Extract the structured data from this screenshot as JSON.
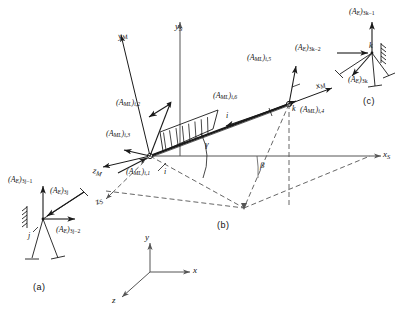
{
  "figure": {
    "background_color": "#ffffff",
    "line_color": "#1a1a1a",
    "dashed_color": "#555555"
  },
  "captions": {
    "a": "(a)",
    "b": "(b)",
    "c": "(c)"
  },
  "axes": {
    "member_x": "x",
    "member_x_sub": "M",
    "member_y": "y",
    "member_y_sub": "M",
    "member_z": "z",
    "member_z_sub": "M",
    "structure_x": "x",
    "structure_x_sub": "S",
    "structure_y": "y",
    "structure_y_sub": "S",
    "structure_z": "z",
    "structure_z_sub": "S",
    "global_x": "x",
    "global_y": "y",
    "global_z": "z"
  },
  "angles": {
    "gamma": "γ",
    "beta": "β"
  },
  "nodes": {
    "i": "i",
    "k": "k",
    "member_length": "i",
    "inset_a_node": "j",
    "inset_c_node": "k"
  },
  "member_loads": {
    "prefix": "(A",
    "prefix_sub": "ML",
    "close": ")",
    "items": [
      {
        "id": "aml_i1",
        "sub": "i,1"
      },
      {
        "id": "aml_i2",
        "sub": "i,2"
      },
      {
        "id": "aml_i3",
        "sub": "i,3"
      },
      {
        "id": "aml_i4",
        "sub": "i,4"
      },
      {
        "id": "aml_i5",
        "sub": "i,5"
      },
      {
        "id": "aml_i6",
        "sub": "i,6"
      }
    ]
  },
  "equivalent_loads": {
    "prefix": "(A",
    "prefix_sub": "E",
    "close": ")",
    "inset_a": [
      {
        "id": "ae_3jm1",
        "sub": "3j−1"
      },
      {
        "id": "ae_3j",
        "sub": "3j"
      },
      {
        "id": "ae_3jm2",
        "sub": "3j−2"
      }
    ],
    "inset_c": [
      {
        "id": "ae_3km1",
        "sub": "3k−1"
      },
      {
        "id": "ae_3km2",
        "sub": "3k−2"
      },
      {
        "id": "ae_3k",
        "sub": "3k"
      }
    ]
  },
  "labels": {
    "aml_i1_text": "(A<sub>ML</sub>)<sub>i,1</sub>",
    "aml_i2_text": "(A<sub>ML</sub>)<sub>i,2</sub>",
    "aml_i3_text": "(A<sub>ML</sub>)<sub>i,3</sub>",
    "aml_i4_text": "(A<sub>ML</sub>)<sub>i,4</sub>",
    "aml_i5_text": "(A<sub>ML</sub>)<sub>i,5</sub>",
    "aml_i6_text": "(A<sub>ML</sub>)<sub>i,6</sub>"
  }
}
